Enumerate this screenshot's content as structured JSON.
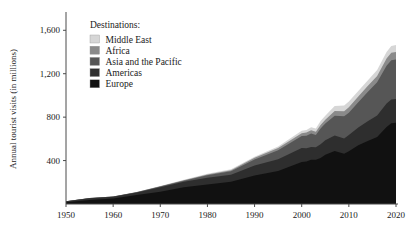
{
  "chart_data": {
    "type": "area",
    "title": "",
    "subtitle": "",
    "xlabel": "",
    "ylabel": "Annual tourist visits (in millions)",
    "stacked": true,
    "grid": false,
    "legend_position": "top-left-inside",
    "legend_title": "Destinations:",
    "xlim": [
      1950,
      2020
    ],
    "ylim": [
      0,
      1750
    ],
    "xticks": [
      "1950",
      "1960",
      "1970",
      "1980",
      "1990",
      "2000",
      "2010",
      "2020"
    ],
    "xtick_values": [
      1950,
      1960,
      1970,
      1980,
      1990,
      2000,
      2010,
      2020
    ],
    "yticks": [
      "400",
      "800",
      "1,200",
      "1,600"
    ],
    "ytick_values": [
      400,
      800,
      1200,
      1600
    ],
    "x": [
      1950,
      1955,
      1960,
      1965,
      1970,
      1975,
      1980,
      1985,
      1990,
      1995,
      2000,
      2001,
      2002,
      2003,
      2004,
      2005,
      2007,
      2009,
      2010,
      2012,
      2014,
      2016,
      2018,
      2019,
      2020
    ],
    "series": [
      {
        "name": "Europe",
        "color": "#111111",
        "values": [
          16.8,
          36.8,
          50.4,
          83.7,
          113.0,
          153.9,
          178.5,
          204.3,
          261.5,
          304.1,
          386.6,
          390.8,
          407.4,
          408.6,
          424.4,
          453.2,
          487.9,
          461.7,
          484.8,
          541.0,
          580.2,
          616.2,
          710.0,
          744.0,
          748.0
        ]
      },
      {
        "name": "Americas",
        "color": "#2e2e2e",
        "values": [
          7.5,
          16.7,
          16.7,
          23.2,
          42.3,
          50.0,
          62.3,
          65.1,
          92.8,
          109.0,
          128.2,
          122.4,
          116.7,
          113.1,
          125.8,
          133.3,
          142.9,
          140.7,
          150.1,
          163.1,
          181.9,
          200.0,
          215.7,
          219.5,
          220.0
        ]
      },
      {
        "name": "Asia and the Pacific",
        "color": "#565656",
        "values": [
          0.2,
          0.8,
          0.9,
          2.1,
          6.2,
          10.2,
          23.0,
          31.2,
          56.2,
          82.1,
          110.4,
          115.7,
          124.9,
          113.3,
          144.2,
          154.6,
          182.0,
          205.5,
          205.4,
          233.5,
          269.5,
          306.0,
          347.7,
          360.1,
          362.0
        ]
      },
      {
        "name": "Africa",
        "color": "#8a8a8a",
        "values": [
          0.5,
          0.8,
          0.8,
          1.4,
          2.4,
          4.7,
          7.2,
          9.7,
          15.2,
          20.0,
          26.5,
          29.1,
          29.5,
          30.7,
          33.2,
          35.4,
          43.0,
          46.0,
          49.9,
          52.4,
          55.2,
          57.8,
          67.1,
          70.2,
          70.0
        ]
      },
      {
        "name": "Middle East",
        "color": "#d6d6d6",
        "values": [
          0.2,
          0.6,
          0.6,
          1.1,
          1.9,
          3.5,
          7.1,
          9.0,
          9.6,
          13.7,
          24.1,
          23.6,
          27.6,
          29.5,
          36.3,
          36.3,
          46.5,
          52.4,
          54.7,
          51.7,
          51.0,
          54.0,
          60.1,
          61.4,
          65.0
        ]
      }
    ],
    "legend": [
      {
        "label": "Middle East",
        "color": "#d6d6d6"
      },
      {
        "label": "Africa",
        "color": "#8a8a8a"
      },
      {
        "label": "Asia and the Pacific",
        "color": "#565656"
      },
      {
        "label": "Americas",
        "color": "#2e2e2e"
      },
      {
        "label": "Europe",
        "color": "#111111"
      }
    ]
  }
}
